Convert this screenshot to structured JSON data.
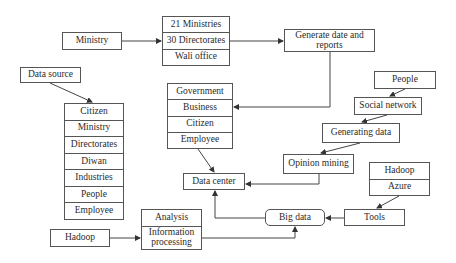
{
  "diagram": {
    "nodes": {
      "ministry": "Ministry",
      "ministry_units": [
        "21 Ministries",
        "30 Directorates",
        "Wali office"
      ],
      "generate_reports": "Generate date and reports",
      "data_source": "Data source",
      "source_list": [
        "Citizen",
        "Ministry",
        "Directorates",
        "Diwan",
        "Industries",
        "People",
        "Employee"
      ],
      "stakeholders": [
        "Government",
        "Business",
        "Citizen",
        "Employee"
      ],
      "people": "People",
      "social_network": "Social network",
      "generating_data": "Generating data",
      "opinion_mining": "Opinion mining",
      "data_center": "Data center",
      "cloud_tools": [
        "Hadoop",
        "Azure"
      ],
      "tools": "Tools",
      "big_data": "Big data",
      "processing": [
        "Analysis",
        "Information processing"
      ],
      "hadoop": "Hadoop"
    },
    "edges": [
      {
        "from": "Ministry",
        "to": "30 Directorates"
      },
      {
        "from": "30 Directorates",
        "to": "Generate date and reports"
      },
      {
        "from": "Generate date and reports",
        "to": "Business"
      },
      {
        "from": "Data source",
        "to": "Citizen"
      },
      {
        "from": "Employee",
        "to": "Data center"
      },
      {
        "from": "People",
        "to": "Social network"
      },
      {
        "from": "Social network",
        "to": "Generating data"
      },
      {
        "from": "Generating data",
        "to": "Opinion mining"
      },
      {
        "from": "Opinion mining",
        "to": "Data center"
      },
      {
        "from": "Azure",
        "to": "Tools"
      },
      {
        "from": "Tools",
        "to": "Big data"
      },
      {
        "from": "Big data",
        "to": "Data center"
      },
      {
        "from": "Hadoop",
        "to": "Information processing"
      },
      {
        "from": "Information processing",
        "to": "Big data"
      }
    ]
  }
}
